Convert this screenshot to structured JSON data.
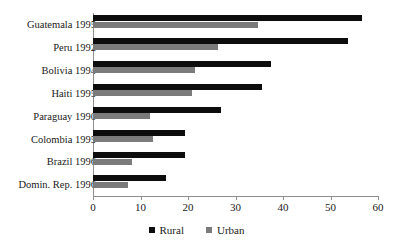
{
  "chart_data": {
    "type": "bar",
    "orientation": "horizontal",
    "title": "",
    "xlabel": "",
    "ylabel": "",
    "xlim": [
      0,
      60
    ],
    "xticks": [
      0,
      10,
      20,
      30,
      40,
      50,
      60
    ],
    "grid": false,
    "legend_position": "bottom-center",
    "categories": [
      "Guatemala 1995",
      "Peru 1992",
      "Bolivia 1994",
      "Haiti 1995",
      "Paraguay 1990",
      "Colombia 1995",
      "Brazil 1996",
      "Domin. Rep. 1996"
    ],
    "series": [
      {
        "name": "Rural",
        "color": "#0d0d0d",
        "values": [
          56.6,
          53.7,
          37.5,
          35.6,
          27.0,
          19.4,
          19.4,
          15.4
        ]
      },
      {
        "name": "Urban",
        "color": "#7b7b7b",
        "values": [
          34.8,
          26.3,
          21.5,
          20.8,
          12.0,
          12.6,
          8.2,
          7.4
        ]
      }
    ]
  },
  "legend": {
    "items": [
      {
        "label": "Rural",
        "swatch": "rural-swatch-icon"
      },
      {
        "label": "Urban",
        "swatch": "urban-swatch-icon"
      }
    ]
  },
  "axis": {
    "tick_labels": [
      "0",
      "10",
      "20",
      "30",
      "40",
      "50",
      "60"
    ]
  }
}
